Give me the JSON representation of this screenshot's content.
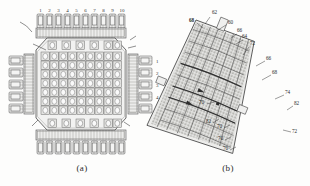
{
  "figure": {
    "background_color": "#fdfdfc",
    "line_color": "#4a4a4a",
    "fill_light": "#efefee",
    "fill_mid": "#d8d8d6",
    "fill_dark": "#bdbdba"
  },
  "panels": [
    {
      "id": "a",
      "caption": "(a)",
      "type": "square-lattice-cross-section",
      "top_labels": [
        "1",
        "2",
        "3",
        "4",
        "5",
        "6",
        "7",
        "8",
        "9",
        "10"
      ],
      "right_labels": [
        "1",
        "2",
        "3",
        "4",
        "5"
      ],
      "top_tab_count": 10,
      "bottom_tab_count": 10,
      "left_tab_count": 5,
      "right_tab_count": 5,
      "grid_columns": 10,
      "grid_rows": 10,
      "callout_labels": [
        "8",
        "6"
      ]
    },
    {
      "id": "b",
      "caption": "(b)",
      "type": "curved-fan-lattice-section",
      "reference_numbers": [
        "62",
        "60",
        "68",
        "66",
        "64",
        "66",
        "72",
        "66",
        "68",
        "74",
        "82",
        "70",
        "82",
        "70",
        "70",
        "70",
        "72"
      ],
      "labels": [
        {
          "text": "62",
          "x": 212,
          "y": 12
        },
        {
          "text": "60",
          "x": 228,
          "y": 22
        },
        {
          "text": "68",
          "x": 192,
          "y": 21
        },
        {
          "text": "66",
          "x": 238,
          "y": 31
        },
        {
          "text": "64",
          "x": 243,
          "y": 37
        },
        {
          "text": "72",
          "x": 250,
          "y": 43
        },
        {
          "text": "66",
          "x": 266,
          "y": 58
        },
        {
          "text": "68",
          "x": 272,
          "y": 72
        },
        {
          "text": "74",
          "x": 285,
          "y": 92
        },
        {
          "text": "82",
          "x": 294,
          "y": 103
        },
        {
          "text": "70",
          "x": 201,
          "y": 102
        },
        {
          "text": "82",
          "x": 208,
          "y": 121
        },
        {
          "text": "70",
          "x": 218,
          "y": 126
        },
        {
          "text": "72",
          "x": 293,
          "y": 130
        },
        {
          "text": "70",
          "x": 219,
          "y": 138
        },
        {
          "text": "70",
          "x": 224,
          "y": 148
        }
      ]
    }
  ]
}
